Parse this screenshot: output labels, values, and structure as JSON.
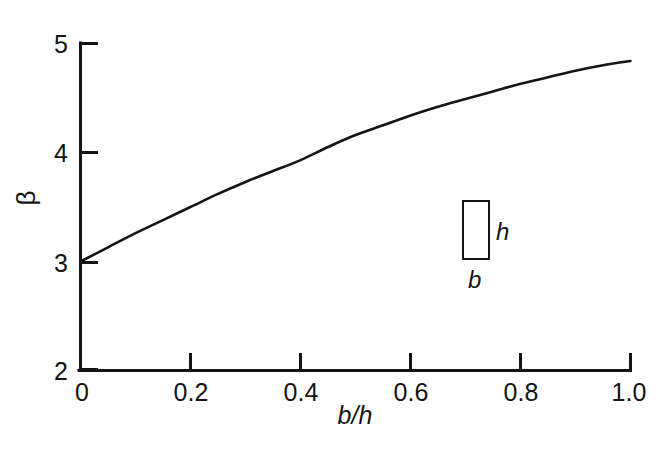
{
  "chart_data": {
    "type": "line",
    "title": "",
    "subtitle": "",
    "xlabel": "b/h",
    "ylabel": "β",
    "xlim": [
      0,
      1.0
    ],
    "ylim": [
      2,
      5
    ],
    "grid": false,
    "legend": null,
    "x_ticks": [
      0,
      0.2,
      0.4,
      0.6,
      0.8,
      1.0
    ],
    "x_tick_labels": [
      "0",
      "0.2",
      "0.4",
      "0.6",
      "0.8",
      "1.0"
    ],
    "y_ticks": [
      2,
      3,
      4,
      5
    ],
    "y_tick_labels": [
      "2",
      "3",
      "4",
      "5"
    ],
    "tick_direction": "in",
    "series": [
      {
        "name": "beta",
        "x": [
          0.0,
          0.05,
          0.1,
          0.15,
          0.2,
          0.25,
          0.3,
          0.35,
          0.4,
          0.45,
          0.5,
          0.55,
          0.6,
          0.65,
          0.7,
          0.75,
          0.8,
          0.85,
          0.9,
          0.95,
          1.0
        ],
        "values": [
          3.0,
          3.13,
          3.26,
          3.38,
          3.5,
          3.62,
          3.73,
          3.83,
          3.93,
          4.05,
          4.16,
          4.25,
          4.34,
          4.42,
          4.49,
          4.56,
          4.63,
          4.69,
          4.75,
          4.8,
          4.84
        ]
      }
    ],
    "annotations": [
      {
        "name": "inset-rect-label-h",
        "text": "h",
        "style": "italic"
      },
      {
        "name": "inset-rect-label-b",
        "text": "b",
        "style": "italic"
      }
    ],
    "colors": {
      "line": "#141414",
      "axis": "#141414",
      "background": "#ffffff",
      "text": "#141414"
    }
  },
  "axes": {
    "x_title": "b/h",
    "y_title": "β"
  },
  "inset": {
    "height_label": "h",
    "width_label": "b"
  }
}
